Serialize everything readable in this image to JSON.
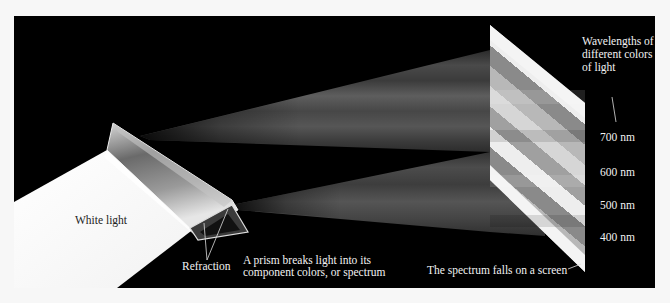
{
  "figure": {
    "background_color": "#000000",
    "page_color": "#f7f7f7",
    "labels": {
      "white_light": "White light",
      "refraction": "Refraction",
      "prism_caption_line1": "A prism breaks light into its",
      "prism_caption_line2": "component colors, or spectrum",
      "screen_caption": "The spectrum falls on a screen",
      "wavelengths_line1": "Wavelengths of",
      "wavelengths_line2": "different colors",
      "wavelengths_line3": "of light"
    },
    "wavelength_ticks": [
      {
        "label": "700 nm"
      },
      {
        "label": "600 nm"
      },
      {
        "label": "500 nm"
      },
      {
        "label": "400 nm"
      }
    ]
  }
}
